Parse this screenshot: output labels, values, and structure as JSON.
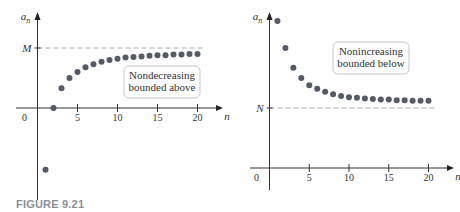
{
  "caption": "FIGURE 9.21",
  "chart_data": [
    {
      "type": "scatter",
      "title": "",
      "annotation": [
        "Nondecreasing",
        "bounded above"
      ],
      "xlabel": "n",
      "ylabel": "a_n",
      "bound_label": "M",
      "bound_value": 1.0,
      "x_ticks": [
        0,
        5,
        10,
        15,
        20
      ],
      "xlim": [
        0,
        21
      ],
      "ylim": [
        -1.5,
        1.4
      ],
      "grid": false,
      "x": [
        1,
        2,
        3,
        4,
        5,
        6,
        7,
        8,
        9,
        10,
        11,
        12,
        13,
        14,
        15,
        16,
        17,
        18,
        19,
        20
      ],
      "values": [
        -1.03,
        0.0,
        0.33,
        0.5,
        0.6,
        0.68,
        0.73,
        0.77,
        0.8,
        0.82,
        0.84,
        0.85,
        0.86,
        0.87,
        0.88,
        0.88,
        0.89,
        0.89,
        0.9,
        0.9
      ]
    },
    {
      "type": "scatter",
      "title": "",
      "annotation": [
        "Nonincreasing",
        "bounded below"
      ],
      "xlabel": "n",
      "ylabel": "a_n",
      "bound_label": "N",
      "bound_value": 1.0,
      "x_ticks": [
        0,
        5,
        10,
        15,
        20
      ],
      "xlim": [
        0,
        21
      ],
      "ylim": [
        -0.4,
        2.5
      ],
      "grid": false,
      "x": [
        1,
        2,
        3,
        4,
        5,
        6,
        7,
        8,
        9,
        10,
        11,
        12,
        13,
        14,
        15,
        16,
        17,
        18,
        19,
        20
      ],
      "values": [
        2.45,
        2.0,
        1.67,
        1.5,
        1.38,
        1.32,
        1.27,
        1.23,
        1.2,
        1.18,
        1.17,
        1.16,
        1.15,
        1.14,
        1.14,
        1.13,
        1.13,
        1.12,
        1.12,
        1.12
      ]
    }
  ]
}
